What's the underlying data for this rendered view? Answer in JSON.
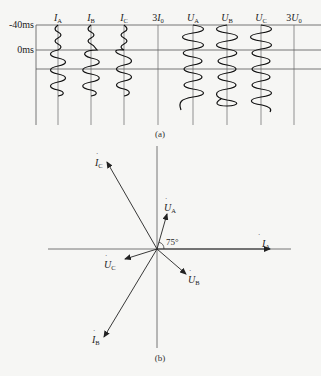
{
  "figure_a": {
    "caption": "(a)",
    "time_labels": {
      "t1": "-40ms",
      "t2": "0ms"
    },
    "channels": [
      {
        "id": "IA",
        "prefix": "",
        "main": "I",
        "sub": "A"
      },
      {
        "id": "IB",
        "prefix": "",
        "main": "I",
        "sub": "B"
      },
      {
        "id": "IC",
        "prefix": "",
        "main": "I",
        "sub": "C"
      },
      {
        "id": "3I0",
        "prefix": "3",
        "main": "I",
        "sub": "0"
      },
      {
        "id": "UA",
        "prefix": "",
        "main": "U",
        "sub": "A"
      },
      {
        "id": "UB",
        "prefix": "",
        "main": "U",
        "sub": "B"
      },
      {
        "id": "UC",
        "prefix": "",
        "main": "U",
        "sub": "C"
      },
      {
        "id": "3U0",
        "prefix": "3",
        "main": "U",
        "sub": "0"
      }
    ]
  },
  "figure_b": {
    "caption": "(b)",
    "angle_label": "75°",
    "phasors": {
      "IA": {
        "main": "I",
        "sub": "A"
      },
      "IB": {
        "main": "I",
        "sub": "B"
      },
      "IC": {
        "main": "I",
        "sub": "C"
      },
      "UA": {
        "main": "U",
        "sub": "A"
      },
      "UB": {
        "main": "U",
        "sub": "B"
      },
      "UC": {
        "main": "U",
        "sub": "C"
      }
    }
  }
}
